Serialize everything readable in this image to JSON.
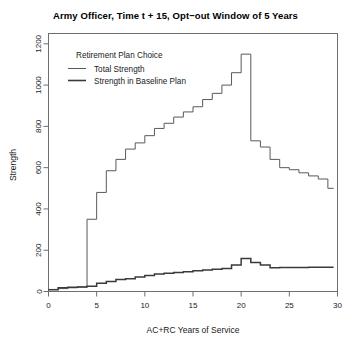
{
  "chart_data": {
    "type": "line",
    "title": "Army Officer, Time t + 15, Opt−out Window of 5 Years",
    "xlabel": "AC+RC Years of Service",
    "ylabel": "Strength",
    "xlim": [
      0,
      30
    ],
    "ylim": [
      0,
      1250
    ],
    "xticks": [
      0,
      5,
      10,
      15,
      20,
      25,
      30
    ],
    "yticks": [
      0,
      200,
      400,
      600,
      800,
      1000,
      1200
    ],
    "grid": false,
    "step_style": "hv",
    "legend": {
      "title": "Retirement Plan Choice",
      "position": "top-left-inside",
      "entries": [
        "Total Strength",
        "Strength in Baseline Plan"
      ]
    },
    "x": [
      0,
      1,
      2,
      3,
      4,
      5,
      6,
      7,
      8,
      9,
      10,
      11,
      12,
      13,
      14,
      15,
      16,
      17,
      18,
      19,
      20,
      21,
      22,
      23,
      24,
      25,
      26,
      27,
      28,
      29
    ],
    "series": [
      {
        "name": "Total Strength",
        "color": "#595959",
        "values": [
          10,
          14,
          18,
          22,
          350,
          480,
          585,
          640,
          690,
          720,
          755,
          790,
          815,
          845,
          870,
          895,
          930,
          960,
          1000,
          1060,
          1150,
          730,
          700,
          640,
          600,
          590,
          575,
          560,
          545,
          500
        ]
      },
      {
        "name": "Strength in Baseline Plan",
        "color": "#3a3a3a",
        "values": [
          8,
          18,
          20,
          22,
          26,
          40,
          48,
          58,
          62,
          70,
          78,
          85,
          88,
          92,
          96,
          100,
          104,
          108,
          112,
          128,
          160,
          140,
          128,
          115,
          116,
          116,
          116,
          118,
          118,
          118
        ]
      }
    ]
  }
}
